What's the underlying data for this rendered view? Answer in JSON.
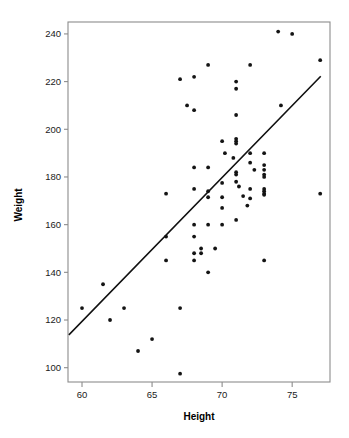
{
  "chart_data": {
    "type": "scatter",
    "title": "",
    "xlabel": "Height",
    "ylabel": "Weight",
    "xlim": [
      59.0,
      77.7
    ],
    "ylim": [
      94.0,
      245.0
    ],
    "grid": false,
    "legend": null,
    "x_ticks": [
      60,
      65,
      70,
      75
    ],
    "y_ticks": [
      100,
      120,
      140,
      160,
      180,
      200,
      220,
      240
    ],
    "x_tick_labels": [
      "60",
      "65",
      "70",
      "75"
    ],
    "y_tick_labels": [
      "100",
      "120",
      "140",
      "160",
      "180",
      "200",
      "220",
      "240"
    ],
    "point_color": "#141414",
    "line_color": "#111111",
    "frame_color": "#8c8c8c",
    "series": [
      {
        "name": "observations",
        "x": [
          60.0,
          61.5,
          62.0,
          63.0,
          64.0,
          65.0,
          66.0,
          66.0,
          66.0,
          67.0,
          67.0,
          67.0,
          67.5,
          68.0,
          68.0,
          68.0,
          68.0,
          68.0,
          68.0,
          68.0,
          68.0,
          68.5,
          68.5,
          69.0,
          69.0,
          69.0,
          69.0,
          69.0,
          69.0,
          69.5,
          70.0,
          70.0,
          70.0,
          70.0,
          70.0,
          70.2,
          70.8,
          71.0,
          71.0,
          71.0,
          71.0,
          71.0,
          71.0,
          71.0,
          71.0,
          71.0,
          71.0,
          71.2,
          71.5,
          71.8,
          72.0,
          72.0,
          72.0,
          72.0,
          72.0,
          72.3,
          73.0,
          73.0,
          73.0,
          73.0,
          73.0,
          73.0,
          73.0,
          73.0,
          73.0,
          73.0,
          74.0,
          74.2,
          75.0,
          77.0,
          77.0
        ],
        "y": [
          125.0,
          135.0,
          120.0,
          125.0,
          107.0,
          112.0,
          173.0,
          155.0,
          145.0,
          221.0,
          125.0,
          97.5,
          210.0,
          222.0,
          208.0,
          184.0,
          175.0,
          160.0,
          155.0,
          148.0,
          145.0,
          148.0,
          150.0,
          227.0,
          184.0,
          174.0,
          171.5,
          160.0,
          140.0,
          150.0,
          195.0,
          177.5,
          167.0,
          160.0,
          171.5,
          190.0,
          188.0,
          220.0,
          217.0,
          206.0,
          196.0,
          195.0,
          194.0,
          182.0,
          181.0,
          178.0,
          162.0,
          176.0,
          172.0,
          168.0,
          227.0,
          190.0,
          186.0,
          175.0,
          171.0,
          183.0,
          190.0,
          185.0,
          183.0,
          181.0,
          180.0,
          175.0,
          174.0,
          173.0,
          172.5,
          145.0,
          241.0,
          210.0,
          240.0,
          229.0,
          173.0
        ]
      }
    ],
    "fit_line": {
      "name": "regression-line",
      "x_start": 59.1,
      "y_start": 114.0,
      "x_end": 77.0,
      "y_end": 222.0
    }
  }
}
